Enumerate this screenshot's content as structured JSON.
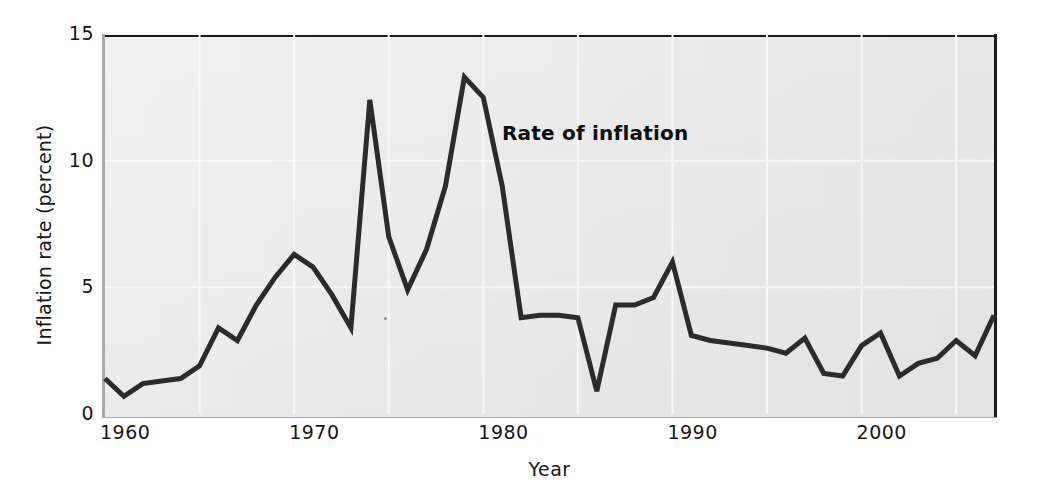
{
  "chart_data": {
    "type": "line",
    "title": "",
    "xlabel": "Year",
    "ylabel": "Inflation rate (percent)",
    "xlim": [
      1960,
      2007
    ],
    "ylim": [
      0,
      15
    ],
    "yticks": [
      0,
      5,
      10,
      15
    ],
    "ytick_labels": [
      "0",
      "5",
      "10",
      "15"
    ],
    "xticks": [
      1960,
      1970,
      1980,
      1990,
      2000
    ],
    "xtick_labels": [
      "1960",
      "1970",
      "1980",
      "1990",
      "2000"
    ],
    "grid": "faint-white-gridlines",
    "legend": "none",
    "annotations": [
      {
        "text": "Rate of inflation",
        "x": 1981.5,
        "y": 11.6,
        "bold": true
      }
    ],
    "series": [
      {
        "name": "Rate of inflation",
        "color": "#2b2b2b",
        "x": [
          1960,
          1961,
          1962,
          1963,
          1964,
          1965,
          1966,
          1967,
          1968,
          1969,
          1970,
          1971,
          1972,
          1973,
          1974,
          1975,
          1976,
          1977,
          1978,
          1979,
          1980,
          1981,
          1982,
          1983,
          1984,
          1985,
          1986,
          1987,
          1988,
          1989,
          1990,
          1991,
          1992,
          1993,
          1994,
          1995,
          1996,
          1997,
          1998,
          1999,
          2000,
          2001,
          2002,
          2003,
          2004,
          2005,
          2006,
          2007
        ],
        "values": [
          1.4,
          0.7,
          1.2,
          1.3,
          1.4,
          1.9,
          3.4,
          2.9,
          4.3,
          5.4,
          6.3,
          5.8,
          4.7,
          3.4,
          12.4,
          7.0,
          4.9,
          6.5,
          9.0,
          13.3,
          12.5,
          9.0,
          3.8,
          3.9,
          3.9,
          3.8,
          0.9,
          4.3,
          4.3,
          4.6,
          6.0,
          3.1,
          2.9,
          2.8,
          2.7,
          2.6,
          2.4,
          3.0,
          1.6,
          1.5,
          2.7,
          3.2,
          1.5,
          2.0,
          2.2,
          2.9,
          2.3,
          3.9
        ]
      }
    ]
  },
  "axes": {
    "y_label": "Inflation rate (percent)",
    "x_label": "Year"
  },
  "annotation": {
    "rate_of_inflation": "Rate of inflation"
  }
}
